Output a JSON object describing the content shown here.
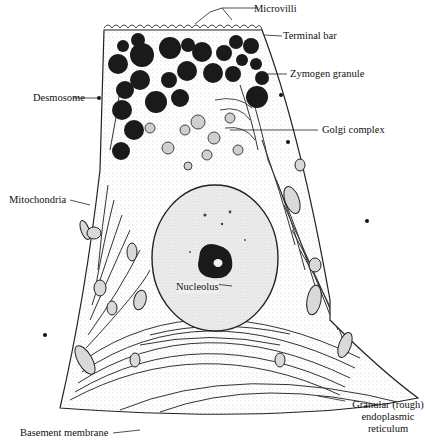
{
  "figure": {
    "labels": {
      "microvilli": "Microvilli",
      "terminal_bar": "Terminal bar",
      "zymogen_granule": "Zymogen granule",
      "desmosome": "Desmosome",
      "golgi_complex": "Golgi complex",
      "mitochondria": "Mitochondria",
      "nucleolus": "Nucleolus",
      "granular_er_line1": "Granular (rough)",
      "granular_er_line2": "endoplasmic",
      "granular_er_line3": "reticulum",
      "basement_membrane": "Basement membrane"
    },
    "colors": {
      "ink": "#111111",
      "granule": "#1a1a1a",
      "nucleus_fill": "#e6e6e6",
      "background": "#ffffff"
    }
  }
}
